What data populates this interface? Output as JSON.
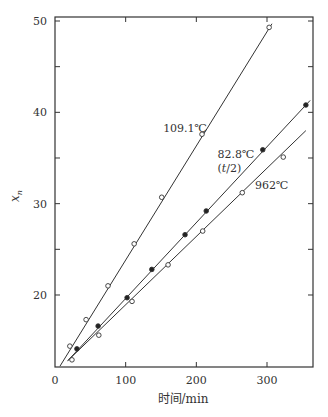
{
  "chart_data": {
    "type": "scatter",
    "title": "",
    "xlabel": "时间/min",
    "ylabel": "x_n",
    "xlim": [
      0,
      365
    ],
    "ylim": [
      12,
      51
    ],
    "xticks": [
      0,
      100,
      200,
      300
    ],
    "yticks": [
      20,
      30,
      40,
      50
    ],
    "y_minor_ticks": [
      25,
      35,
      45
    ],
    "grid": false,
    "legend": "inline labels",
    "series": [
      {
        "name": "109.1℃",
        "label_lines": [
          "109.1℃"
        ],
        "marker": "open-circle",
        "x": [
          21,
          44,
          75,
          112,
          151,
          208,
          303
        ],
        "y": [
          14.4,
          17.3,
          21.0,
          25.6,
          30.7,
          37.6,
          49.3
        ],
        "fit_line": {
          "x": [
            7,
            307
          ],
          "y": [
            12.2,
            49.7
          ]
        },
        "label_pos": {
          "t": 153,
          "xn": 37.8
        }
      },
      {
        "name": "82.8℃ (t/2)",
        "label_lines": [
          "82.8℃",
          "(t/2)"
        ],
        "marker": "filled-circle",
        "x": [
          31,
          61,
          102,
          137,
          184,
          214,
          294,
          355
        ],
        "y": [
          14.1,
          16.6,
          19.7,
          22.8,
          26.6,
          29.2,
          35.9,
          40.8
        ],
        "fit_line": {
          "x": [
            18,
            361
          ],
          "y": [
            12.8,
            41.3
          ]
        },
        "label_pos": {
          "t": 230,
          "xn": 35.0
        }
      },
      {
        "name": "962℃",
        "label_lines": [
          "962℃"
        ],
        "marker": "open-circle",
        "x": [
          24,
          62,
          109,
          160,
          209,
          265,
          323
        ],
        "y": [
          12.9,
          15.6,
          19.3,
          23.3,
          27.0,
          31.2,
          35.1
        ],
        "fit_line": {
          "x": [
            18,
            355
          ],
          "y": [
            12.8,
            38.0
          ]
        },
        "label_pos": {
          "t": 283,
          "xn": 31.6
        }
      }
    ]
  }
}
